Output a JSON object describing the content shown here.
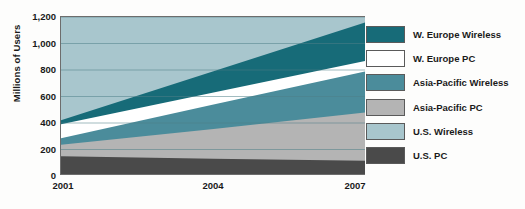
{
  "chart_data": {
    "type": "area",
    "title": "",
    "xlabel": "",
    "ylabel": "Millions of Users",
    "stacked": true,
    "grid": true,
    "legend_position": "right",
    "x": [
      2001,
      2004,
      2007
    ],
    "xlim": [
      2001,
      2007
    ],
    "ylim": [
      0,
      1200
    ],
    "ytick_labels": [
      "0",
      "200",
      "400",
      "600",
      "800",
      "1,000",
      "1,200"
    ],
    "ytick_values": [
      0,
      200,
      400,
      600,
      800,
      1000,
      1200
    ],
    "xtick_labels": [
      "2001",
      "2004",
      "2007"
    ],
    "categories": [
      "2001",
      "2004",
      "2007"
    ],
    "series": [
      {
        "name": "U.S. PC",
        "color": "#4a4a4a",
        "values": [
          150,
          130,
          115
        ]
      },
      {
        "name": "Asia-Pacific PC",
        "color": "#b4b4b4",
        "values": [
          235,
          355,
          480
        ]
      },
      {
        "name": "Asia-Pacific Wireless",
        "color": "#4b8c9b",
        "values": [
          285,
          540,
          790
        ]
      },
      {
        "name": "W. Europe PC",
        "color": "#ffffff",
        "values": [
          390,
          630,
          870
        ]
      },
      {
        "name": "W. Europe Wireless",
        "color": "#176b78",
        "values": [
          420,
          790,
          1160
        ]
      },
      {
        "name": "U.S. Wireless",
        "color": "#a8c6cd",
        "values": [
          1200,
          1200,
          1200
        ]
      }
    ]
  },
  "axis": {
    "ylabel": "Millions of Users",
    "yticks": [
      "1,200",
      "1,000",
      "800",
      "600",
      "400",
      "200",
      "0"
    ],
    "xticks": [
      "2001",
      "2004",
      "2007"
    ]
  },
  "legend": {
    "items": [
      {
        "label": "W. Europe Wireless",
        "color": "#176b78"
      },
      {
        "label": "W. Europe PC",
        "color": "#ffffff"
      },
      {
        "label": "Asia-Pacific Wireless",
        "color": "#4b8c9b"
      },
      {
        "label": "Asia-Pacific PC",
        "color": "#b4b4b4"
      },
      {
        "label": "U.S. Wireless",
        "color": "#a8c6cd"
      },
      {
        "label": "U.S. PC",
        "color": "#4a4a4a"
      }
    ]
  },
  "colors": {
    "we_wireless": "#176b78",
    "we_pc": "#ffffff",
    "ap_wireless": "#4b8c9b",
    "ap_pc": "#b4b4b4",
    "us_wireless": "#a8c6cd",
    "us_pc": "#4a4a4a",
    "axis": "#1a1a1a",
    "grid": "#4f7f88"
  }
}
